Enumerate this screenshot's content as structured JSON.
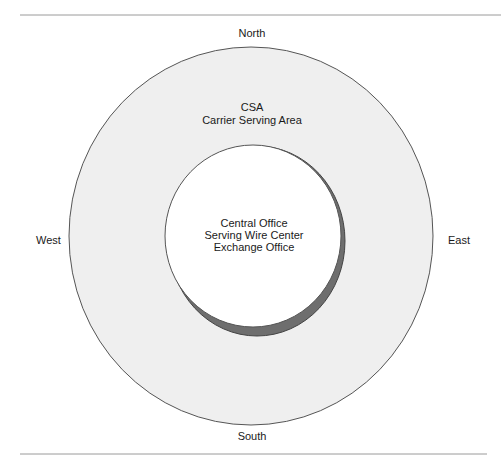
{
  "diagram": {
    "directions": {
      "north": "North",
      "south": "South",
      "east": "East",
      "west": "West"
    },
    "outer_area": {
      "title": "CSA",
      "subtitle": "Carrier Serving Area",
      "fill": "#efefef",
      "stroke": "#555555"
    },
    "inner_area": {
      "line1": "Central Office",
      "line2": "Serving Wire Center",
      "line3": "Exchange Office",
      "fill": "#ffffff",
      "shadow": "#6e6e6e"
    },
    "rule_color": "#9a9a9a"
  }
}
